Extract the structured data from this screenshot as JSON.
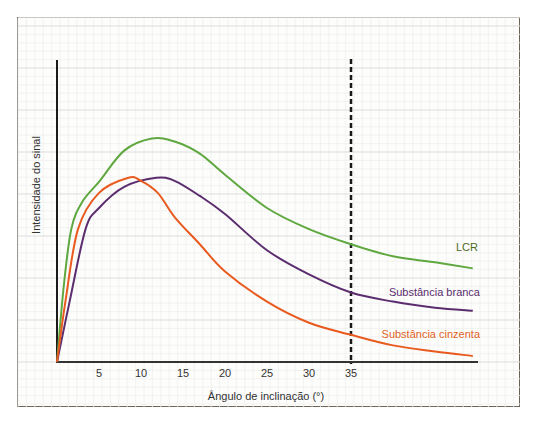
{
  "chart_data": {
    "type": "line",
    "title": "",
    "xlabel": "Ângulo de inclinação (°)",
    "ylabel": "Intensidade do sinal",
    "xlim": [
      0,
      50
    ],
    "ylim": [
      0,
      1
    ],
    "x_ticks": [
      5,
      10,
      15,
      20,
      25,
      30,
      35
    ],
    "grid": true,
    "reference_line": {
      "x": 35,
      "style": "dashed",
      "color": "#1a1a1a"
    },
    "legend_position": "inline-right",
    "series": [
      {
        "name": "LCR",
        "color": "#5fa83f",
        "label_color": "#4d6b1f",
        "points": [
          [
            0,
            0
          ],
          [
            0.8,
            0.25
          ],
          [
            1.7,
            0.44
          ],
          [
            3,
            0.53
          ],
          [
            5.1,
            0.6
          ],
          [
            8,
            0.7
          ],
          [
            11.3,
            0.74
          ],
          [
            14,
            0.73
          ],
          [
            17,
            0.69
          ],
          [
            20,
            0.62
          ],
          [
            25,
            0.51
          ],
          [
            30,
            0.44
          ],
          [
            35,
            0.39
          ],
          [
            40,
            0.35
          ],
          [
            45,
            0.33
          ],
          [
            49.5,
            0.31
          ]
        ]
      },
      {
        "name": "Substância branca",
        "color": "#5b2d6e",
        "label_color": "#5b2d6e",
        "points": [
          [
            0,
            0
          ],
          [
            1.5,
            0.2
          ],
          [
            3.4,
            0.44
          ],
          [
            5,
            0.51
          ],
          [
            8,
            0.58
          ],
          [
            11.8,
            0.61
          ],
          [
            14,
            0.6
          ],
          [
            17,
            0.55
          ],
          [
            20,
            0.49
          ],
          [
            25,
            0.37
          ],
          [
            30,
            0.29
          ],
          [
            35,
            0.23
          ],
          [
            40,
            0.2
          ],
          [
            45,
            0.18
          ],
          [
            49.5,
            0.17
          ]
        ]
      },
      {
        "name": "Substância cinzenta",
        "color": "#e85a1e",
        "label_color": "#e0641f",
        "points": [
          [
            0,
            0
          ],
          [
            1,
            0.2
          ],
          [
            2.5,
            0.44
          ],
          [
            5,
            0.56
          ],
          [
            8.5,
            0.61
          ],
          [
            10,
            0.6
          ],
          [
            12,
            0.56
          ],
          [
            14,
            0.48
          ],
          [
            17,
            0.39
          ],
          [
            20,
            0.3
          ],
          [
            25,
            0.2
          ],
          [
            30,
            0.13
          ],
          [
            35,
            0.09
          ],
          [
            40,
            0.055
          ],
          [
            45,
            0.035
          ],
          [
            49.5,
            0.02
          ]
        ]
      }
    ]
  },
  "labels": {
    "ylabel": "Intensidade do sinal",
    "xlabel": "Ângulo de inclinação (°)",
    "series": [
      "LCR",
      "Substância branca",
      "Substância cinzenta"
    ],
    "ticks": [
      "5",
      "10",
      "15",
      "20",
      "25",
      "30",
      "35"
    ]
  }
}
